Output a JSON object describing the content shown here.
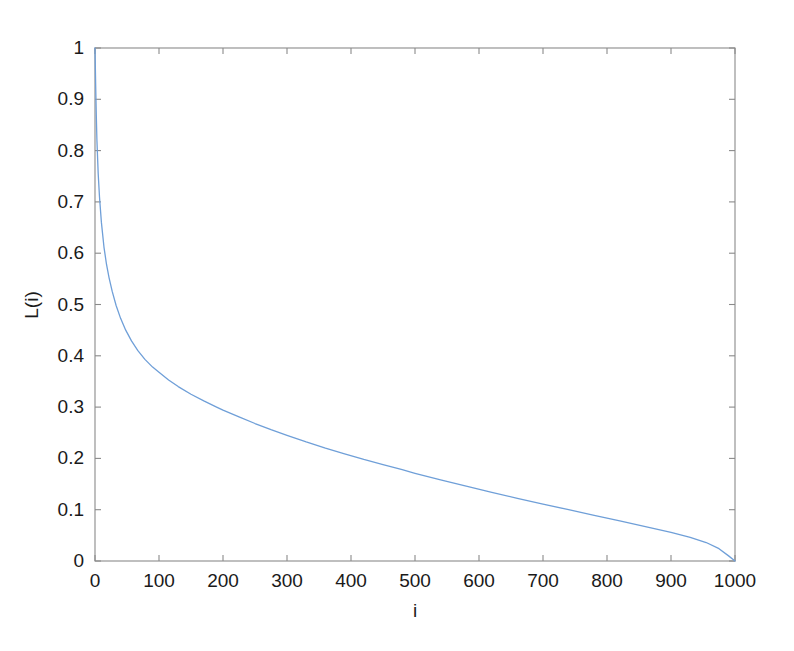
{
  "chart_data": {
    "type": "line",
    "title": "",
    "subtitle": "",
    "xlabel": "i",
    "ylabel": "L(i)",
    "xlim": [
      0,
      1000
    ],
    "ylim": [
      0,
      1
    ],
    "grid": false,
    "legend": null,
    "legend_position": "none",
    "xticks": [
      0,
      100,
      200,
      300,
      400,
      500,
      600,
      700,
      800,
      900,
      1000
    ],
    "xticklabels": [
      "0",
      "100",
      "200",
      "300",
      "400",
      "500",
      "600",
      "700",
      "800",
      "900",
      "1000"
    ],
    "yticks": [
      0,
      0.1,
      0.2,
      0.3,
      0.4,
      0.5,
      0.6,
      0.7,
      0.8,
      0.9,
      1
    ],
    "yticklabels": [
      "0",
      "0.1",
      "0.2",
      "0.3",
      "0.4",
      "0.5",
      "0.6",
      "0.7",
      "0.8",
      "0.9",
      "1"
    ],
    "series": [
      {
        "name": "L(i)",
        "color": "#6f9fd8",
        "linewidth": 1.3,
        "x": [
          0,
          1,
          2,
          3,
          5,
          7,
          10,
          14,
          18,
          22,
          27,
          33,
          40,
          48,
          57,
          67,
          78,
          90,
          100,
          115,
          130,
          150,
          170,
          190,
          200,
          225,
          250,
          275,
          300,
          330,
          360,
          390,
          420,
          450,
          480,
          500,
          540,
          580,
          620,
          660,
          700,
          740,
          780,
          820,
          860,
          900,
          930,
          955,
          975,
          990,
          1000
        ],
        "y": [
          1.0,
          0.93,
          0.87,
          0.82,
          0.755,
          0.71,
          0.66,
          0.612,
          0.578,
          0.552,
          0.525,
          0.498,
          0.473,
          0.45,
          0.429,
          0.41,
          0.393,
          0.378,
          0.368,
          0.353,
          0.34,
          0.325,
          0.312,
          0.3,
          0.294,
          0.281,
          0.268,
          0.256,
          0.245,
          0.232,
          0.22,
          0.209,
          0.198,
          0.188,
          0.178,
          0.171,
          0.158,
          0.146,
          0.134,
          0.122,
          0.111,
          0.1,
          0.089,
          0.078,
          0.067,
          0.056,
          0.046,
          0.036,
          0.024,
          0.01,
          0.0
        ]
      }
    ],
    "axes_color": "#8a8a8a",
    "background": "#ffffff"
  },
  "figure": {
    "tick_font_size": "19px",
    "label_font_size": "19px"
  }
}
